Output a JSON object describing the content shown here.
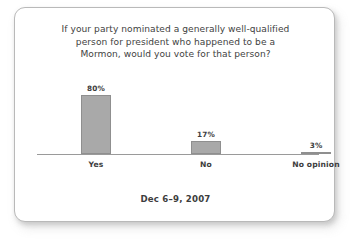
{
  "card": {
    "background_color": "#ffffff",
    "border_color": "#b9b9b9"
  },
  "chart_data": {
    "type": "bar",
    "title": "If your party nominated a generally well-qualified person for president who happened to be a Mormon, would you vote for that person?",
    "title_lines": [
      "If your party nominated a generally well-qualified",
      "person for president who happened to be a",
      "Mormon, would you vote for that person?"
    ],
    "caption": "Dec 6–9, 2007",
    "categories": [
      "Yes",
      "No",
      "No opinion"
    ],
    "values": [
      80,
      17,
      3
    ],
    "value_labels": [
      "80%",
      "17%",
      "3%"
    ],
    "xlabel": "",
    "ylabel": "",
    "ylim": [
      0,
      100
    ],
    "grid": false,
    "legend": "none",
    "bar_color": "#a9a9a9",
    "bar_border_color": "#8f8f8f",
    "axis_color": "#9a9a9a",
    "text_color": "#3d3d3d"
  }
}
